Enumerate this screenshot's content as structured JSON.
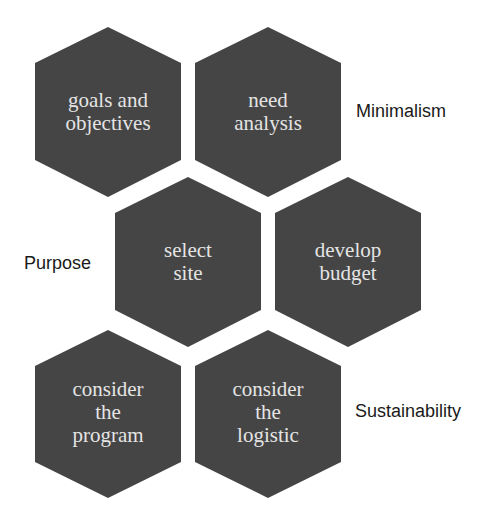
{
  "diagram": {
    "type": "hexagon-cluster",
    "colors": {
      "hex_fill": "#454545",
      "hex_text": "#e4e4e4",
      "side_text": "#1a1a1a",
      "background": "#ffffff"
    },
    "hexagons": [
      {
        "id": "goals",
        "label": "goals and\nobjectives",
        "cx": 108,
        "cy": 112
      },
      {
        "id": "need",
        "label": "need\nanalysis",
        "cx": 268,
        "cy": 112
      },
      {
        "id": "select",
        "label": "select\nsite",
        "cx": 188,
        "cy": 262
      },
      {
        "id": "budget",
        "label": "develop\nbudget",
        "cx": 348,
        "cy": 262
      },
      {
        "id": "program",
        "label": "consider\nthe\nprogram",
        "cx": 108,
        "cy": 412
      },
      {
        "id": "logistic",
        "label": "consider\nthe\nlogistic",
        "cx": 268,
        "cy": 412
      }
    ],
    "side_labels": {
      "minimalism": "Minimalism",
      "purpose": "Purpose",
      "sustainability": "Sustainability"
    }
  }
}
